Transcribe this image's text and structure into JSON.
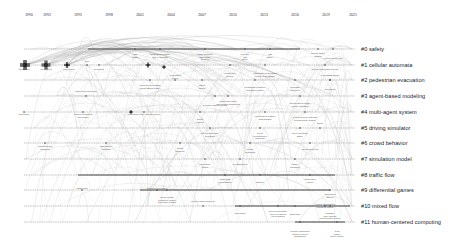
{
  "timeline": {
    "years": [
      {
        "label": "1990",
        "x": 29
      },
      {
        "label": "1992",
        "x": 47
      },
      {
        "label": "1995",
        "x": 78
      },
      {
        "label": "1998",
        "x": 109
      },
      {
        "label": "2001",
        "x": 140
      },
      {
        "label": "2004",
        "x": 171
      },
      {
        "label": "2007",
        "x": 202
      },
      {
        "label": "2010",
        "x": 233
      },
      {
        "label": "2013",
        "x": 264
      },
      {
        "label": "2016",
        "x": 295
      },
      {
        "label": "2019",
        "x": 326
      },
      {
        "label": "2021",
        "x": 353
      }
    ]
  },
  "clusters": [
    {
      "id": "#0",
      "label": "#0 safety",
      "y": 49
    },
    {
      "id": "#1",
      "label": "#1 cellular automata",
      "y": 65
    },
    {
      "id": "#2",
      "label": "#2 pedestrian evacuation",
      "y": 80
    },
    {
      "id": "#3",
      "label": "#3 agent-based modeling",
      "y": 96
    },
    {
      "id": "#4",
      "label": "#4 multi-agent system",
      "y": 112
    },
    {
      "id": "#5",
      "label": "#5 driving simulator",
      "y": 128
    },
    {
      "id": "#6",
      "label": "#6 crowd behavior",
      "y": 143
    },
    {
      "id": "#7",
      "label": "#7 simulation model",
      "y": 159
    },
    {
      "id": "#8",
      "label": "#8 traffic flow",
      "y": 175
    },
    {
      "id": "#9",
      "label": "#9 differential games",
      "y": 190
    },
    {
      "id": "#10",
      "label": "#10 mixed flow",
      "y": 206
    },
    {
      "id": "#11",
      "label": "#11 human-centered computing",
      "y": 222
    }
  ],
  "timeline_lines": [
    {
      "cluster": "#0",
      "x1": 24,
      "x2": 355,
      "y": 49,
      "thick_from": 88,
      "thick_to": 300
    },
    {
      "cluster": "#1",
      "x1": 24,
      "x2": 355,
      "y": 65,
      "thick_from": 0,
      "thick_to": 0
    },
    {
      "cluster": "#2",
      "x1": 24,
      "x2": 355,
      "y": 80,
      "thick_from": 0,
      "thick_to": 0
    },
    {
      "cluster": "#3",
      "x1": 24,
      "x2": 355,
      "y": 96,
      "thick_from": 0,
      "thick_to": 0
    },
    {
      "cluster": "#4",
      "x1": 24,
      "x2": 355,
      "y": 112,
      "thick_from": 0,
      "thick_to": 0
    },
    {
      "cluster": "#5",
      "x1": 24,
      "x2": 355,
      "y": 128,
      "thick_from": 0,
      "thick_to": 0
    },
    {
      "cluster": "#6",
      "x1": 24,
      "x2": 355,
      "y": 143,
      "thick_from": 0,
      "thick_to": 0
    },
    {
      "cluster": "#7",
      "x1": 24,
      "x2": 355,
      "y": 159,
      "thick_from": 0,
      "thick_to": 0
    },
    {
      "cluster": "#8",
      "x1": 24,
      "x2": 355,
      "y": 175,
      "thick_from": 78,
      "thick_to": 335
    },
    {
      "cluster": "#9",
      "x1": 24,
      "x2": 355,
      "y": 190,
      "thick_from": 140,
      "thick_to": 330
    },
    {
      "cluster": "#10",
      "x1": 24,
      "x2": 355,
      "y": 206,
      "thick_from": 235,
      "thick_to": 350
    },
    {
      "cluster": "#11",
      "x1": 24,
      "x2": 355,
      "y": 222,
      "thick_from": 295,
      "thick_to": 345
    }
  ],
  "major_nodes": [
    {
      "x": 25,
      "y": 65,
      "size": 10,
      "label": "integration"
    },
    {
      "x": 46,
      "y": 65,
      "size": 9,
      "label": "pedestrian"
    },
    {
      "x": 67,
      "y": 65,
      "size": 6,
      "label": "connectivity"
    },
    {
      "x": 148,
      "y": 65,
      "size": 5,
      "label": ""
    },
    {
      "x": 131,
      "y": 112,
      "size": 4,
      "label": ""
    },
    {
      "x": 164,
      "y": 67,
      "size": 4,
      "label": ""
    }
  ],
  "node_labels": [
    {
      "x": 24,
      "y": 68,
      "text": "integration"
    },
    {
      "x": 46,
      "y": 68,
      "text": "pedestrian"
    },
    {
      "x": 69,
      "y": 68,
      "text": "connectivity"
    },
    {
      "x": 87,
      "y": 60,
      "text": "time"
    },
    {
      "x": 99,
      "y": 68,
      "text": "dynamics"
    },
    {
      "x": 86,
      "y": 90,
      "text": "traffic simulation tool"
    },
    {
      "x": 24,
      "y": 113,
      "text": "simulation"
    },
    {
      "x": 83,
      "y": 113,
      "text": "vehicle-pedestrian\ninteraction"
    },
    {
      "x": 144,
      "y": 113,
      "text": "pedestrian  fuzzy agent system"
    },
    {
      "x": 45,
      "y": 145,
      "text": "management\nmodeling"
    },
    {
      "x": 106,
      "y": 145,
      "text": "aggregation\nproblem"
    },
    {
      "x": 82,
      "y": 187,
      "text": "traffic flow"
    },
    {
      "x": 157,
      "y": 187,
      "text": "planning simulation"
    },
    {
      "x": 167,
      "y": 196,
      "text": "control model\nsensitivity model\ncomputer system"
    },
    {
      "x": 203,
      "y": 200,
      "text": "layered warm behavior"
    },
    {
      "x": 240,
      "y": 212,
      "text": "uncertainty"
    },
    {
      "x": 278,
      "y": 210,
      "text": "mixed flow  safety\ncircle prediction\ncar-following"
    },
    {
      "x": 295,
      "y": 213,
      "text": "traffic jam"
    },
    {
      "x": 330,
      "y": 212,
      "text": "highway\nlane-change\nmixed traffic control"
    },
    {
      "x": 300,
      "y": 230,
      "text": "human computing\nhuman-vehicle\nautomation"
    },
    {
      "x": 337,
      "y": 230,
      "text": "trust\nfusion\ndriver model"
    },
    {
      "x": 325,
      "y": 203,
      "text": "vehicle automation\nintelligent model"
    },
    {
      "x": 205,
      "y": 53,
      "text": "traffic demand\nrisk model\ncollision"
    },
    {
      "x": 245,
      "y": 53,
      "text": "freeway\nrisk\nsafety"
    },
    {
      "x": 270,
      "y": 53,
      "text": "risk\nsafety"
    },
    {
      "x": 318,
      "y": 52,
      "text": "driving  safety\nfatigue"
    },
    {
      "x": 333,
      "y": 57,
      "text": "vehicle driver risk"
    },
    {
      "x": 160,
      "y": 53,
      "text": "information system\nsafety analysis"
    },
    {
      "x": 135,
      "y": 53,
      "text": "risk\nmodel"
    },
    {
      "x": 325,
      "y": 68,
      "text": "cellular automaton model"
    },
    {
      "x": 265,
      "y": 72,
      "text": "pedestrian evacuation\nsocial force model"
    },
    {
      "x": 230,
      "y": 72,
      "text": "crowd flow\ndensity"
    },
    {
      "x": 330,
      "y": 74,
      "text": "evacuation model"
    },
    {
      "x": 175,
      "y": 74,
      "text": "evacuation\nmodel"
    },
    {
      "x": 150,
      "y": 84,
      "text": "computer simulation\nagent-based model"
    },
    {
      "x": 202,
      "y": 84,
      "text": "agent\nmodel"
    },
    {
      "x": 255,
      "y": 86,
      "text": "pedestrian behavior\nsimulation model"
    },
    {
      "x": 295,
      "y": 86,
      "text": "bounded\nrationality"
    },
    {
      "x": 330,
      "y": 88,
      "text": "simulation"
    },
    {
      "x": 228,
      "y": 100,
      "text": "traffic simulation\nagent-based modeling"
    },
    {
      "x": 300,
      "y": 102,
      "text": "agent-based model\nmodel validation"
    },
    {
      "x": 215,
      "y": 104,
      "text": "decision making model"
    },
    {
      "x": 265,
      "y": 115,
      "text": "multi-agent system\ncoordination"
    },
    {
      "x": 305,
      "y": 116,
      "text": "reinforcement learning\nautonomous vehicle"
    },
    {
      "x": 200,
      "y": 118,
      "text": "agent\nsystem"
    },
    {
      "x": 320,
      "y": 122,
      "text": "agent"
    },
    {
      "x": 210,
      "y": 132,
      "text": "driving simulator\nbehavior"
    },
    {
      "x": 260,
      "y": 132,
      "text": "driver\nperformance\nsimulator"
    },
    {
      "x": 300,
      "y": 132,
      "text": "driver behavior\nsafety"
    },
    {
      "x": 180,
      "y": 147,
      "text": "crowd\nbehavior"
    },
    {
      "x": 250,
      "y": 148,
      "text": "crowd\ndynamics"
    },
    {
      "x": 310,
      "y": 148,
      "text": "crowd modeling"
    },
    {
      "x": 205,
      "y": 163,
      "text": "simulation\nmodel"
    },
    {
      "x": 240,
      "y": 163,
      "text": "programming"
    },
    {
      "x": 295,
      "y": 163,
      "text": "model\nvalidation"
    },
    {
      "x": 225,
      "y": 178,
      "text": "traffic flow\ncar following"
    },
    {
      "x": 260,
      "y": 181,
      "text": "stability"
    },
    {
      "x": 310,
      "y": 178,
      "text": "traffic flow\nmodel"
    },
    {
      "x": 330,
      "y": 193,
      "text": "differential\ngames"
    }
  ],
  "colors": {
    "background": "#ffffff",
    "timeline_line": "#9a9a9a",
    "timeline_thick": "#3a3a3a",
    "link": "#c8c8c8",
    "node": "#444444",
    "label_text": "#222222",
    "year_text": "#333333"
  }
}
